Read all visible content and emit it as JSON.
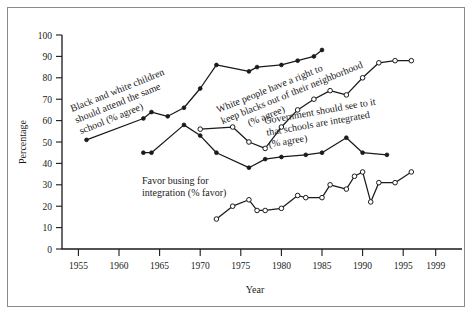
{
  "chart_data": {
    "type": "line",
    "title": "",
    "xlabel": "Year",
    "ylabel": "Percentage",
    "xlim": [
      1953,
      2000
    ],
    "ylim": [
      0,
      100
    ],
    "grid": false,
    "legend_position": "inline-annotations",
    "xticks": [
      "1955",
      "1960",
      "1965",
      "1970",
      "1975",
      "1980",
      "1985",
      "1990",
      "1995",
      "1999"
    ],
    "xtick_values": [
      1955,
      1960,
      1965,
      1970,
      1975,
      1980,
      1985,
      1990,
      1995,
      1999
    ],
    "yticks": [
      "0",
      "10",
      "20",
      "30",
      "40",
      "50",
      "60",
      "70",
      "80",
      "90",
      "100"
    ],
    "ytick_values": [
      0,
      10,
      20,
      30,
      40,
      50,
      60,
      70,
      80,
      90,
      100
    ],
    "series": [
      {
        "name": "Black and white children should attend the same school (% agree)",
        "marker": "filled-circle",
        "x": [
          1956,
          1963,
          1964,
          1966,
          1968,
          1970,
          1972,
          1976,
          1977,
          1980,
          1982,
          1984,
          1985
        ],
        "values": [
          51,
          61,
          64,
          62,
          66,
          75,
          86,
          83,
          85,
          86,
          88,
          90,
          93
        ]
      },
      {
        "name": "White people have a right to keep blacks out of their neighborhood (% agree)",
        "marker": "filled-circle",
        "x": [
          1963,
          1964,
          1968,
          1970,
          1972,
          1976,
          1978,
          1980,
          1983,
          1985,
          1988,
          1990,
          1993
        ],
        "values": [
          45,
          45,
          58,
          53,
          45,
          38,
          42,
          43,
          44,
          45,
          52,
          45,
          44
        ]
      },
      {
        "name": "Government should see to it that schools are integrated (% agree)",
        "marker": "open-circle",
        "x": [
          1970,
          1974,
          1976,
          1978,
          1980,
          1982,
          1984,
          1986,
          1988,
          1990,
          1992,
          1994,
          1996
        ],
        "values": [
          56,
          57,
          50,
          47,
          57,
          65,
          70,
          74,
          72,
          80,
          87,
          88,
          88
        ]
      },
      {
        "name": "Favor busing for integration (% favor)",
        "marker": "open-circle",
        "x": [
          1972,
          1974,
          1976,
          1977,
          1978,
          1980,
          1982,
          1983,
          1985,
          1986,
          1988,
          1989,
          1990,
          1991,
          1992,
          1994,
          1996
        ],
        "values": [
          14,
          20,
          23,
          18,
          18,
          19,
          25,
          24,
          24,
          30,
          28,
          34,
          36,
          22,
          31,
          31,
          36
        ]
      }
    ],
    "annotations": [
      {
        "id": "annotation-school",
        "text_lines": [
          "Black and white children",
          "should attend the same",
          "school (% agree)"
        ],
        "rotation": -22
      },
      {
        "id": "annotation-neighborhood",
        "text_lines": [
          "White people have a right to",
          "keep blacks out of their neighborhood",
          "(% agree)"
        ],
        "rotation": -22
      },
      {
        "id": "annotation-government",
        "text_lines": [
          "Government should see to it",
          "that schools are integrated",
          "(% agree)"
        ],
        "rotation": -10
      },
      {
        "id": "annotation-busing",
        "text_lines": [
          "Favor busing for",
          "integration (% favor)"
        ],
        "rotation": 0
      }
    ]
  },
  "axes": {
    "y_title": "Percentage",
    "x_title": "Year"
  },
  "colors": {
    "ink": "#1a1a1a",
    "frame": "#8a8a8a",
    "background": "#ffffff"
  }
}
